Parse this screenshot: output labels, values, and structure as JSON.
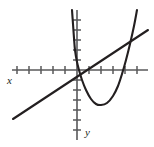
{
  "figure": {
    "width": 154,
    "height": 147,
    "background_color": "#ffffff",
    "axis_color": "#58585a",
    "curve_color": "#231f20",
    "labels": {
      "x_axis": "x",
      "y_axis": "y"
    }
  },
  "chart_data": {
    "type": "line",
    "title": "",
    "xlabel": "x",
    "ylabel": "y",
    "grid": false,
    "legend": null,
    "axes": {
      "origin_px": [
        77,
        70
      ],
      "x_axis_px": {
        "y": 70,
        "x_start": 12,
        "x_end": 148
      },
      "y_axis_px": {
        "x": 77,
        "y_start": 10,
        "y_end": 140
      },
      "x_tick_spacing_px": 12,
      "y_tick_spacing_px": 10,
      "x_ticks_px": [
        17,
        29,
        41,
        53,
        65,
        77,
        89,
        101,
        113,
        125,
        137
      ],
      "y_ticks_px": [
        20,
        30,
        40,
        50,
        60,
        80,
        90,
        100,
        110,
        120,
        130
      ],
      "tick_half_length_px": 4,
      "xlim": [
        -5,
        6
      ],
      "ylim": [
        -6,
        5
      ]
    },
    "series": [
      {
        "name": "parabola",
        "type": "quadratic-curve",
        "opens": "up",
        "vertex_px": [
          101,
          105
        ],
        "points_px": [
          [
            72,
            10
          ],
          [
            73,
            24
          ],
          [
            74,
            38
          ],
          [
            75,
            50
          ],
          [
            77,
            62
          ],
          [
            79,
            70
          ],
          [
            82,
            80
          ],
          [
            86,
            90
          ],
          [
            91,
            99
          ],
          [
            96,
            104
          ],
          [
            101,
            105
          ],
          [
            107,
            103
          ],
          [
            113,
            96
          ],
          [
            118,
            86
          ],
          [
            122,
            74
          ],
          [
            126,
            60
          ],
          [
            130,
            44
          ],
          [
            134,
            26
          ],
          [
            137,
            10
          ]
        ]
      },
      {
        "name": "straight-line",
        "type": "linear",
        "points_px": [
          [
            13,
            119
          ],
          [
            148,
            30
          ]
        ]
      }
    ]
  }
}
